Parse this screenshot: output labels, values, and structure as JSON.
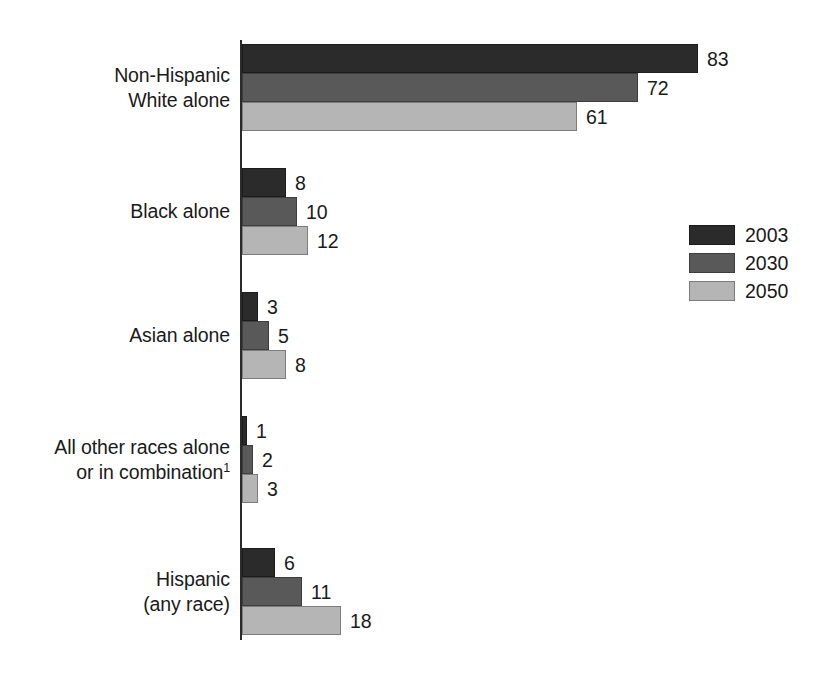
{
  "chart_data": {
    "type": "bar",
    "orientation": "horizontal",
    "title": "",
    "subtitle": "",
    "xlabel": "",
    "ylabel": "",
    "grid": false,
    "legend_position": "right",
    "xlim": [
      0,
      83
    ],
    "categories": [
      "Non-Hispanic\nWhite alone",
      "Black alone",
      "Asian alone",
      "All other races alone\nor in combination",
      "Hispanic\n(any race)"
    ],
    "category_footnotes": [
      "",
      "",
      "",
      "1",
      ""
    ],
    "series": [
      {
        "name": "2003",
        "color": "#2b2b2b",
        "values": [
          83,
          8,
          3,
          1,
          6
        ]
      },
      {
        "name": "2030",
        "color": "#595959",
        "values": [
          72,
          10,
          5,
          2,
          11
        ]
      },
      {
        "name": "2050",
        "color": "#b5b5b5",
        "values": [
          61,
          12,
          8,
          3,
          18
        ]
      }
    ],
    "value_labels": [
      [
        "83",
        "72",
        "61"
      ],
      [
        "8",
        "10",
        "12"
      ],
      [
        "3",
        "5",
        "8"
      ],
      [
        "1",
        "2",
        "3"
      ],
      [
        "6",
        "11",
        "18"
      ]
    ]
  },
  "legend": {
    "entries": [
      {
        "label": "2003",
        "color": "#2b2b2b"
      },
      {
        "label": "2030",
        "color": "#595959"
      },
      {
        "label": "2050",
        "color": "#b5b5b5"
      }
    ]
  },
  "axis": {
    "color": "#2b2b2b"
  }
}
